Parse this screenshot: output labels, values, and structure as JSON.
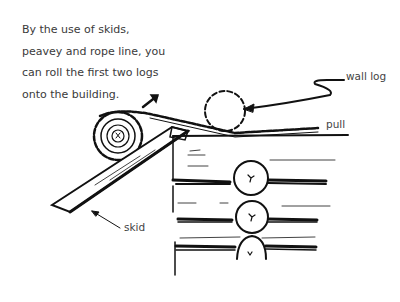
{
  "caption": {
    "lines": [
      "By the use of skids,",
      "peavey and rope line, you",
      "can roll the first two logs",
      "onto the building."
    ]
  },
  "labels": {
    "wall_log": "wall log",
    "pull": "pull",
    "skid": "skid"
  },
  "colors": {
    "ink": "#111111",
    "text": "#3a3a3a",
    "background": "#ffffff"
  }
}
